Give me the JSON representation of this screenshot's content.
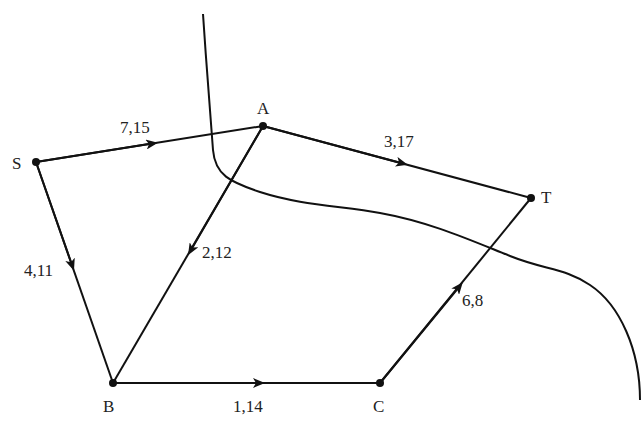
{
  "diagram": {
    "type": "directed network flow graph with cut",
    "colors": {
      "stroke": "#111111",
      "text": "#222222",
      "background": "#ffffff"
    },
    "nodes": [
      {
        "id": "S",
        "label": "S",
        "x": 36,
        "y": 162
      },
      {
        "id": "A",
        "label": "A",
        "x": 263,
        "y": 126
      },
      {
        "id": "T",
        "label": "T",
        "x": 531,
        "y": 198
      },
      {
        "id": "B",
        "label": "B",
        "x": 113,
        "y": 383
      },
      {
        "id": "C",
        "label": "C",
        "x": 380,
        "y": 383
      }
    ],
    "edges": [
      {
        "from": "S",
        "to": "A",
        "label": "7,15"
      },
      {
        "from": "A",
        "to": "T",
        "label": "3,17"
      },
      {
        "from": "S",
        "to": "B",
        "label": "4,11"
      },
      {
        "from": "A",
        "to": "B",
        "label": "2,12"
      },
      {
        "from": "B",
        "to": "C",
        "label": "1,14"
      },
      {
        "from": "C",
        "to": "T",
        "label": "6,8"
      }
    ],
    "cut": {
      "label": "cut curve",
      "crosses": [
        "S-A",
        "A-B",
        "C-T"
      ]
    }
  }
}
